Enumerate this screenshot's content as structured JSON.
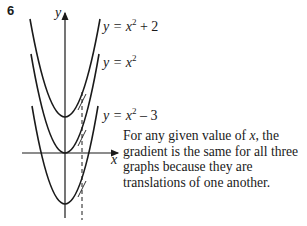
{
  "question": {
    "number": "6"
  },
  "graph": {
    "y_axis_label": "y",
    "x_axis_label": "x",
    "curves": [
      {
        "name": "y = x^2 + 2",
        "lhs": "y = ",
        "var": "x",
        "exp": "2",
        "rhs": " + 2",
        "vertex_y_shift": 2
      },
      {
        "name": "y = x^2",
        "lhs": "y = ",
        "var": "x",
        "exp": "2",
        "rhs": "",
        "vertex_y_shift": 0
      },
      {
        "name": "y = x^2 - 3",
        "lhs": "y = ",
        "var": "x",
        "exp": "2",
        "rhs": " – 3",
        "vertex_y_shift": -3
      }
    ],
    "dashed_line": "vertical line at a given x-value with parallel tangents drawn on each curve",
    "colors": {
      "ink": "#1a1a1a",
      "background": "#ffffff"
    }
  },
  "explanation": {
    "part1": "For any given value of ",
    "var": "x",
    "part2": ", the gradient is the same for all three graphs because they are translations of one another."
  }
}
